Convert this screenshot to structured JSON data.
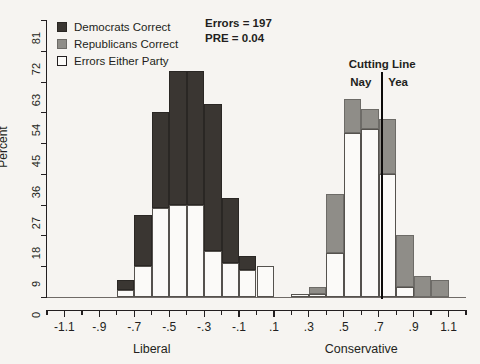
{
  "chart_data": {
    "type": "bar",
    "title": "",
    "subtitle": "",
    "xlabel": "",
    "ylabel": "Percent",
    "axis_group_labels": [
      "Liberal",
      "Conservative"
    ],
    "xlim": [
      -1.2,
      1.2
    ],
    "ylim": [
      0,
      81
    ],
    "bin_width": 0.1,
    "grid": false,
    "legend_position": "top-left",
    "stacked": true,
    "x_tick_labels": [
      "-1.1",
      "-.9",
      "-.7",
      "-.5",
      "-.3",
      "-.1",
      ".1",
      ".3",
      ".5",
      ".7",
      ".9",
      "1.1"
    ],
    "x_tick_values": [
      -1.1,
      -0.9,
      -0.7,
      -0.5,
      -0.3,
      -0.1,
      0.1,
      0.3,
      0.5,
      0.7,
      0.9,
      1.1
    ],
    "x_minor_tick_values": [
      -1.2,
      -1.0,
      -0.8,
      -0.6,
      -0.4,
      -0.2,
      0.0,
      0.2,
      0.4,
      0.6,
      0.8,
      1.0,
      1.2
    ],
    "y_tick_labels": [
      "0",
      "9",
      "18",
      "27",
      "36",
      "45",
      "54",
      "63",
      "72",
      "81"
    ],
    "y_tick_values": [
      0,
      9,
      18,
      27,
      36,
      45,
      54,
      63,
      72,
      81
    ],
    "bin_centers": [
      -0.75,
      -0.65,
      -0.55,
      -0.45,
      -0.35,
      -0.25,
      -0.15,
      -0.05,
      0.05,
      0.15,
      0.25,
      0.35,
      0.45,
      0.55,
      0.65,
      0.75,
      0.85,
      0.95,
      1.05
    ],
    "series": [
      {
        "name": "Errors Either Party",
        "color": "#fbfaf8",
        "values": [
          2,
          9,
          26,
          27,
          27,
          13.5,
          10,
          8,
          9,
          0,
          1,
          1,
          13,
          48,
          49,
          36,
          3,
          0,
          0
        ]
      },
      {
        "name": "Democrats Correct",
        "color": "#3a3632",
        "values": [
          3,
          15,
          28,
          39,
          39,
          43,
          19,
          4,
          0,
          0,
          0,
          0,
          0,
          0,
          0,
          0,
          0,
          0,
          0
        ]
      },
      {
        "name": "Republicans Correct",
        "color": "#8f8d88",
        "values": [
          0,
          0,
          0,
          0,
          0,
          0,
          0,
          0,
          0,
          0,
          0,
          2,
          17,
          10,
          6,
          16,
          15,
          6,
          5
        ]
      }
    ],
    "stack_totals": [
      5,
      24,
      54,
      66,
      66,
      56.5,
      29,
      12,
      9,
      0,
      1,
      3,
      30,
      58,
      55,
      52,
      18,
      6,
      5
    ],
    "annotations": {
      "errors": "Errors = 197",
      "pre": "PRE = 0.04",
      "cutting_line": "Cutting Line",
      "nay": "Nay",
      "yea": "Yea",
      "cutting_line_value": 0.72
    }
  },
  "legend": {
    "items": [
      {
        "label": "Democrats Correct",
        "swatch": "dem-swatch-icon"
      },
      {
        "label": "Republicans Correct",
        "swatch": "rep-swatch-icon"
      },
      {
        "label": "Errors Either Party",
        "swatch": "err-swatch-icon"
      }
    ]
  }
}
